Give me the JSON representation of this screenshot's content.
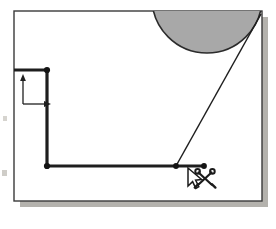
{
  "canvas": {
    "name": "drawing-canvas",
    "background_color": "#ffffff",
    "frame": {
      "x": 14,
      "y": 11,
      "width": 248,
      "height": 190,
      "border_color": "#ululu",
      "border_color_hex": "#3a3a3a",
      "border_width": 1.4
    },
    "shadow": {
      "color": "#b4b2ad",
      "offset_x": 6,
      "offset_y": 6
    },
    "page_background": "#ffffff"
  },
  "shapes": {
    "shaded_circle": {
      "name": "shaded-circle",
      "label": "",
      "center_x": 207,
      "center_y": -2,
      "radius": 55,
      "fill_color": "#a8a8a8",
      "stroke_color": "#2b2b2b",
      "stroke_width": 1.6,
      "clipped_at_frame_top": true
    },
    "polyline": {
      "name": "bold-polyline",
      "stroke_color": "#1e1e1e",
      "stroke_width": 3.2,
      "points": [
        {
          "x": 14,
          "y": 70,
          "vertex_dot": false
        },
        {
          "x": 47,
          "y": 70,
          "vertex_dot": true
        },
        {
          "x": 47,
          "y": 166,
          "vertex_dot": true
        },
        {
          "x": 176,
          "y": 166,
          "vertex_dot": true
        },
        {
          "x": 204,
          "y": 166,
          "vertex_dot": true
        }
      ],
      "dot_radius": 2.8,
      "dot_color": "#141414"
    },
    "diagonal_line": {
      "name": "diagonal-cut-line",
      "stroke_color": "#1e1e1e",
      "stroke_width": 1.5,
      "x1": 261,
      "y1": 14,
      "x2": 176,
      "y2": 166
    },
    "axis_indicator": {
      "name": "coordinate-axis-indicator",
      "origin_x": 23,
      "origin_y": 104,
      "vertical_arrow_to_y": 76,
      "horizontal_arrow_to_x": 50,
      "stroke_color": "#1f1f1f",
      "stroke_width": 1.3,
      "y_axis_label": "",
      "x_axis_label": ""
    }
  },
  "cursor": {
    "name": "mouse-pointer-with-scissors",
    "pointer_tip_x": 188,
    "pointer_tip_y": 168,
    "pointer_fill": "#ffffff",
    "pointer_stroke": "#1b1b1b",
    "tool_icon": "scissors-icon",
    "tool_icon_x": 205,
    "tool_icon_y": 178,
    "tool_icon_color": "#1b1b1b",
    "tooltip": ""
  },
  "artifacts": {
    "left_margin_specks": [
      {
        "x": 3,
        "y": 116,
        "w": 4,
        "h": 5,
        "color": "#d6d4cf"
      },
      {
        "x": 2,
        "y": 170,
        "w": 5,
        "h": 6,
        "color": "#cfcdc8"
      }
    ]
  }
}
